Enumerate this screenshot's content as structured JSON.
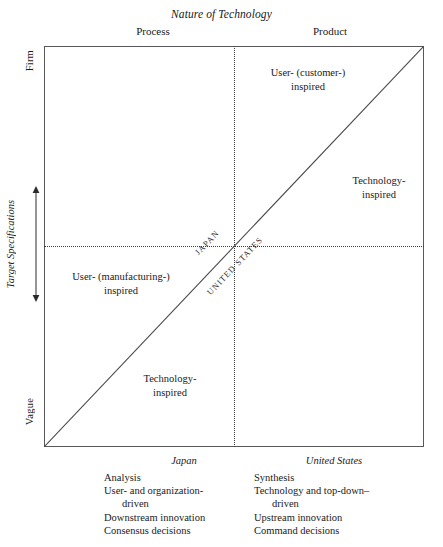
{
  "figure": {
    "top_title": "Nature of Technology",
    "column_headers": {
      "left": "Process",
      "right": "Product"
    },
    "y_axis": {
      "title": "Target Specifications",
      "top_label": "Firm",
      "bottom_label": "Vague"
    },
    "quadrants": {
      "top_right_of_divider": "User- (customer-)\ninspired",
      "far_right": "Technology-\ninspired",
      "middle_left": "User- (manufacturing-)\ninspired",
      "bottom_left": "Technology-\ninspired"
    },
    "diagonal_labels": {
      "above": "JAPAN",
      "below": "UNITED STATES"
    },
    "colors": {
      "frame": "#58585a",
      "dotted": "#3a3a3a",
      "text": "#1a1a1a"
    }
  },
  "comparison": {
    "columns": [
      {
        "heading": "Japan",
        "items": [
          "Analysis",
          "User- and organization-\ndriven",
          "Downstream innovation",
          "Consensus decisions"
        ]
      },
      {
        "heading": "United States",
        "items": [
          "Synthesis",
          "Technology and top-down–\ndriven",
          "Upstream innovation",
          "Command decisions"
        ]
      }
    ]
  }
}
